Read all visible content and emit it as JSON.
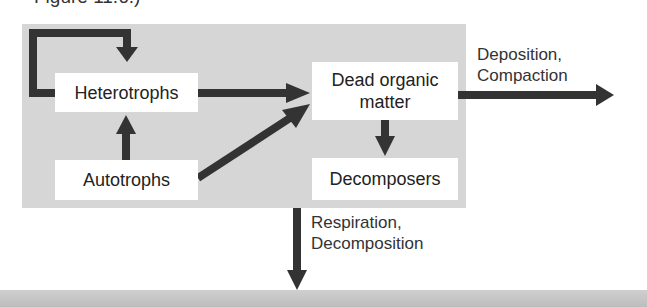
{
  "caption": "Figure 11.6.)",
  "nodes": {
    "heterotrophs": "Heterotrophs",
    "autotrophs": "Autotrophs",
    "dead_organic_matter": "Dead organic matter",
    "decomposers": "Decomposers"
  },
  "flows": {
    "deposition": [
      "Deposition,",
      "Compaction"
    ],
    "respiration": [
      "Respiration,",
      "Decomposition"
    ]
  },
  "colors": {
    "panel": "#d6d6d6",
    "arrow": "#333333",
    "node": "#ffffff"
  }
}
